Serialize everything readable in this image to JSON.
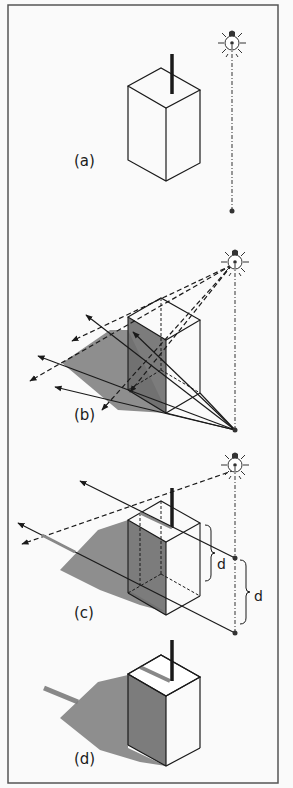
{
  "figure": {
    "panels": [
      {
        "id": "a",
        "label": "(a)"
      },
      {
        "id": "b",
        "label": "(b)"
      },
      {
        "id": "c",
        "label": "(c)",
        "dimension_labels": [
          "d",
          "d"
        ]
      },
      {
        "id": "d",
        "label": "(d)"
      }
    ]
  },
  "colors": {
    "ink": "#1a1a1a",
    "shadow": "#7a7a7a",
    "shade_face": "#6e6e6e",
    "background": "#fafafa",
    "frame": "#555555"
  }
}
